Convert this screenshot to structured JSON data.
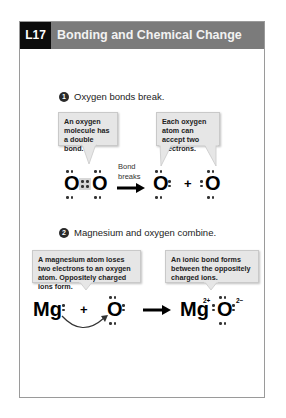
{
  "header": {
    "lesson": "L17",
    "title": "Bonding and Chemical Change",
    "lesson_bg": "#0c0c0c",
    "title_bg": "#7b7b7b"
  },
  "section1": {
    "number": "1",
    "heading": "Oxygen bonds break.",
    "bubble_left": "An oxygen molecule has a double bond.",
    "bubble_right": "Each oxygen atom can accept two electrons.",
    "reactant": {
      "atom1": "O",
      "atom2": "O",
      "shared_electrons": 4
    },
    "arrow_label_1": "Bond",
    "arrow_label_2": "breaks",
    "product": {
      "atom1": "O",
      "plus": "+",
      "atom2": "O"
    }
  },
  "section2": {
    "number": "2",
    "heading": "Magnesium and oxygen combine.",
    "bubble_left": "A magnesium atom loses two electrons to an oxygen atom. Oppositely charged ions form.",
    "bubble_right": "An ionic bond forms between the oppositely charged ions.",
    "reactant": {
      "atom1": "Mg",
      "plus": "+",
      "atom2": "O"
    },
    "product": {
      "atom1": "Mg",
      "charge1": "2+",
      "atom2": "O",
      "charge2": "2−"
    }
  }
}
